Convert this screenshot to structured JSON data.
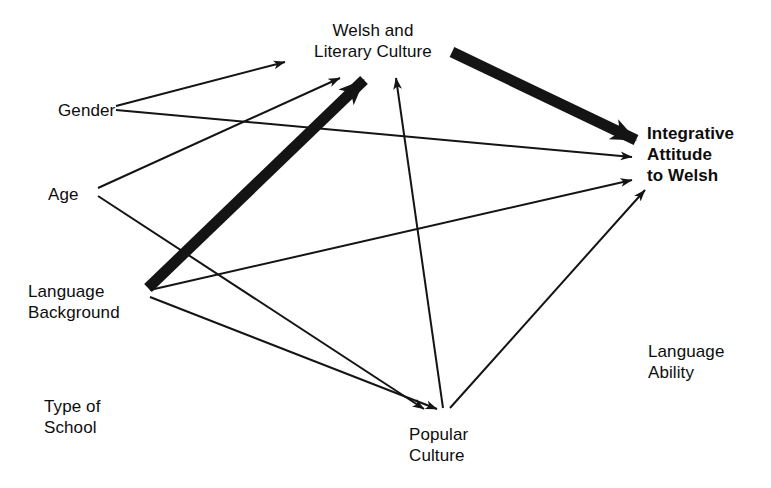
{
  "diagram": {
    "background_color": "#ffffff",
    "line_color": "#141414",
    "nodes": [
      {
        "id": "gender",
        "label": "Gender",
        "lines": [
          "Gender"
        ],
        "x": 58,
        "y": 100,
        "align": "left",
        "bold": false,
        "anchor_x": 107,
        "anchor_y": 108
      },
      {
        "id": "age",
        "label": "Age",
        "lines": [
          "Age"
        ],
        "x": 48,
        "y": 184,
        "align": "left",
        "bold": false,
        "anchor_x": 89,
        "anchor_y": 192
      },
      {
        "id": "language-background",
        "label": "Language Background",
        "lines": [
          "Language",
          "Background"
        ],
        "x": 28,
        "y": 281,
        "align": "left",
        "bold": false,
        "anchor_x": 140,
        "anchor_y": 292
      },
      {
        "id": "type-of-school",
        "label": "Type of School",
        "lines": [
          "Type of",
          "School"
        ],
        "x": 44,
        "y": 396,
        "align": "left",
        "bold": false,
        "anchor_x": 110,
        "anchor_y": 418
      },
      {
        "id": "welsh-and-literary-culture",
        "label": "Welsh and Literary Culture",
        "lines": [
          "Welsh and",
          "Literary Culture"
        ],
        "x": 373,
        "y": 20,
        "align": "center",
        "bold": false,
        "anchor_x": 373,
        "anchor_y": 72
      },
      {
        "id": "popular-culture",
        "label": "Popular Culture",
        "lines": [
          "Popular",
          "Culture"
        ],
        "x": 409,
        "y": 424,
        "align": "left",
        "bold": false,
        "anchor_x": 445,
        "anchor_y": 418
      },
      {
        "id": "language-ability",
        "label": "Language Ability",
        "lines": [
          "Language",
          "Ability"
        ],
        "x": 648,
        "y": 341,
        "align": "left",
        "bold": false,
        "anchor_x": 700,
        "anchor_y": 362
      },
      {
        "id": "integrative-attitude-to-welsh",
        "label": "Integrative Attitude to Welsh",
        "lines": [
          "Integrative",
          "Attitude",
          "to Welsh"
        ],
        "x": 647,
        "y": 123,
        "align": "left",
        "bold": true,
        "anchor_x": 640,
        "anchor_y": 160
      }
    ],
    "edges": [
      {
        "id": "gender-to-welsh-culture",
        "from": "gender",
        "to": "welsh-and-literary-culture",
        "weight": "thin",
        "x1": 116,
        "y1": 106,
        "x2": 285,
        "y2": 62
      },
      {
        "id": "gender-to-integrative-attitude",
        "from": "gender",
        "to": "integrative-attitude-to-welsh",
        "weight": "thin",
        "x1": 116,
        "y1": 110,
        "x2": 632,
        "y2": 157
      },
      {
        "id": "age-to-welsh-culture",
        "from": "age",
        "to": "welsh-and-literary-culture",
        "weight": "thin",
        "x1": 98,
        "y1": 188,
        "x2": 340,
        "y2": 78
      },
      {
        "id": "age-to-popular-culture",
        "from": "age",
        "to": "popular-culture",
        "weight": "thin",
        "x1": 98,
        "y1": 196,
        "x2": 424,
        "y2": 409
      },
      {
        "id": "language-background-to-welsh-culture",
        "from": "language-background",
        "to": "welsh-and-literary-culture",
        "weight": "thick",
        "x1": 148,
        "y1": 288,
        "x2": 364,
        "y2": 80
      },
      {
        "id": "language-background-to-integrative-attitude",
        "from": "language-background",
        "to": "integrative-attitude-to-welsh",
        "weight": "thin",
        "x1": 150,
        "y1": 290,
        "x2": 632,
        "y2": 180
      },
      {
        "id": "language-background-to-popular-culture",
        "from": "language-background",
        "to": "popular-culture",
        "weight": "thin",
        "x1": 150,
        "y1": 297,
        "x2": 437,
        "y2": 409
      },
      {
        "id": "popular-culture-to-welsh-culture",
        "from": "popular-culture",
        "to": "welsh-and-literary-culture",
        "weight": "thin",
        "x1": 443,
        "y1": 408,
        "x2": 396,
        "y2": 78
      },
      {
        "id": "popular-culture-to-integrative-attitude",
        "from": "popular-culture",
        "to": "integrative-attitude-to-welsh",
        "weight": "thin",
        "x1": 450,
        "y1": 408,
        "x2": 645,
        "y2": 190
      },
      {
        "id": "welsh-culture-to-integrative-attitude",
        "from": "welsh-and-literary-culture",
        "to": "integrative-attitude-to-welsh",
        "weight": "thick",
        "x1": 452,
        "y1": 52,
        "x2": 636,
        "y2": 140
      }
    ]
  }
}
